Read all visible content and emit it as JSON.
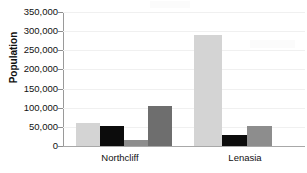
{
  "chart_data": {
    "type": "bar",
    "title": "",
    "xlabel": "",
    "ylabel": "Population",
    "categories": [
      "Northcliff",
      "Lenasia"
    ],
    "ylim": [
      0,
      350000
    ],
    "ytick_step": 50000,
    "ytick_labels": [
      "350,000",
      "300,000",
      "250,000",
      "200,000",
      "150,000",
      "100,000",
      "50,000",
      "0"
    ],
    "ytick_values": [
      350000,
      300000,
      250000,
      200000,
      150000,
      100000,
      50000,
      0
    ],
    "grid": true,
    "legend": "none",
    "series": [
      {
        "name": "series-1",
        "color": "#d4d4d4",
        "values": [
          60000,
          290000
        ]
      },
      {
        "name": "series-2",
        "color": "#0c0c0c",
        "values": [
          52000,
          28000
        ]
      },
      {
        "name": "series-3",
        "color": "#8d8d8d",
        "values": [
          16000,
          53000
        ]
      },
      {
        "name": "series-4",
        "color": "#6e6e6e",
        "values": [
          105000,
          null
        ]
      }
    ],
    "bars": [
      {
        "group": "Northcliff",
        "series": "series-1",
        "value": 60000,
        "color": "#d4d4d4",
        "x": 13,
        "width": 24
      },
      {
        "group": "Northcliff",
        "series": "series-2",
        "value": 52000,
        "color": "#0c0c0c",
        "x": 37,
        "width": 24
      },
      {
        "group": "Northcliff",
        "series": "series-3",
        "value": 16000,
        "color": "#8d8d8d",
        "x": 61,
        "width": 24
      },
      {
        "group": "Northcliff",
        "series": "series-4",
        "value": 105000,
        "color": "#6e6e6e",
        "x": 85,
        "width": 24
      },
      {
        "group": "Lenasia",
        "series": "series-1",
        "value": 290000,
        "color": "#d4d4d4",
        "x": 131,
        "width": 28
      },
      {
        "group": "Lenasia",
        "series": "series-2",
        "value": 28000,
        "color": "#0c0c0c",
        "x": 159,
        "width": 25
      },
      {
        "group": "Lenasia",
        "series": "series-3",
        "value": 53000,
        "color": "#8d8d8d",
        "x": 184,
        "width": 25
      }
    ],
    "category_positions": [
      60,
      185
    ]
  }
}
